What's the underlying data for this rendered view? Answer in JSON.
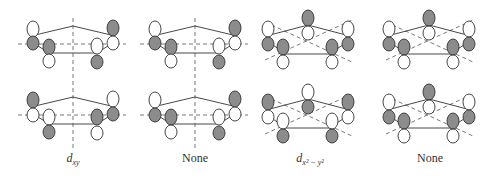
{
  "colors": {
    "shaded": "#8c8c8c",
    "unshaded": "#ffffff",
    "stroke": "#333333",
    "dash": "#555555"
  },
  "labels": [
    {
      "id": "d_xy",
      "main": "d",
      "sub": "xy",
      "x": 73
    },
    {
      "id": "none_1",
      "main": "None",
      "sub": "",
      "x": 195
    },
    {
      "id": "d_x2_y2",
      "main": "d",
      "sub": "x² − y²",
      "x": 310
    },
    {
      "id": "none_2",
      "main": "None",
      "sub": "",
      "x": 430
    }
  ],
  "diagrams": [
    {
      "id": "diagram-1",
      "title": "d_xy symmetry (top & bottom orientations)"
    },
    {
      "id": "diagram-2",
      "title": "None"
    },
    {
      "id": "diagram-3",
      "title": "d_x2-y2 symmetry"
    },
    {
      "id": "diagram-4",
      "title": "None"
    }
  ]
}
